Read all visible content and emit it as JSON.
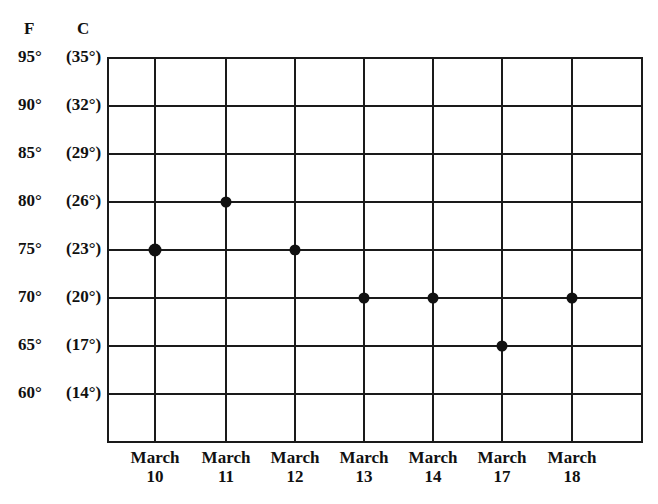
{
  "chart_data": {
    "type": "scatter",
    "title": "",
    "xlabel": "",
    "ylabel": "",
    "axis_headers": {
      "fahrenheit": "F",
      "celsius": "C"
    },
    "categories": [
      "March 10",
      "March 11",
      "March 12",
      "March 13",
      "March 14",
      "March 17",
      "March 18"
    ],
    "x_tick_labels": [
      {
        "line1": "March",
        "line2": "10"
      },
      {
        "line1": "March",
        "line2": "11"
      },
      {
        "line1": "March",
        "line2": "12"
      },
      {
        "line1": "March",
        "line2": "13"
      },
      {
        "line1": "March",
        "line2": "14"
      },
      {
        "line1": "March",
        "line2": "17"
      },
      {
        "line1": "March",
        "line2": "18"
      }
    ],
    "y_ticks": [
      {
        "f": "95°",
        "c": "(35°)",
        "value": 95
      },
      {
        "f": "90°",
        "c": "(32°)",
        "value": 90
      },
      {
        "f": "85°",
        "c": "(29°)",
        "value": 85
      },
      {
        "f": "80°",
        "c": "(26°)",
        "value": 80
      },
      {
        "f": "75°",
        "c": "(23°)",
        "value": 75
      },
      {
        "f": "70°",
        "c": "(20°)",
        "value": 70
      },
      {
        "f": "65°",
        "c": "(17°)",
        "value": 65
      },
      {
        "f": "60°",
        "c": "(14°)",
        "value": 60
      }
    ],
    "series": [
      {
        "name": "Temperature (°F)",
        "values": [
          75,
          80,
          75,
          70,
          70,
          65,
          70
        ]
      }
    ],
    "ylim": [
      55,
      95
    ],
    "grid": true,
    "legend": "none"
  }
}
